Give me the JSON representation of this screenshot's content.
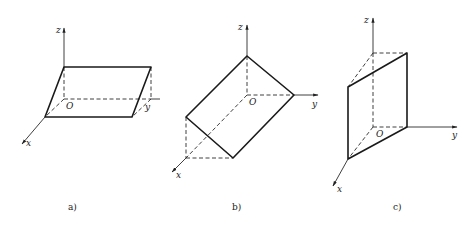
{
  "figure": {
    "panels": [
      {
        "id": "a",
        "caption": "a)",
        "axes": {
          "x": "x",
          "y": "y",
          "z": "z",
          "origin": "O"
        },
        "description": "Parallelogram plane perpendicular to z-axis... lying in a plane parallel to xOy plane above it"
      },
      {
        "id": "b",
        "caption": "b)",
        "axes": {
          "x": "x",
          "y": "y",
          "z": "z",
          "origin": "O"
        },
        "description": "Rectangle plane inclined, passing through z-axis and y-axis points, parallel to x-axis"
      },
      {
        "id": "c",
        "caption": "c)",
        "axes": {
          "x": "x",
          "y": "y",
          "z": "z",
          "origin": "O"
        },
        "description": "Parallelogram plane vertical, parallel to z-axis"
      }
    ]
  }
}
